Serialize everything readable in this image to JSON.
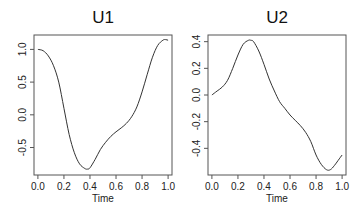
{
  "chart_data": [
    {
      "type": "line",
      "title": "U1",
      "xlabel": "Time",
      "ylabel": "",
      "xlim": [
        -0.03,
        1.03
      ],
      "ylim": [
        -0.92,
        1.22
      ],
      "xticks": [
        0.0,
        0.2,
        0.4,
        0.6,
        0.8,
        1.0
      ],
      "xtick_labels": [
        "0.0",
        "0.2",
        "0.4",
        "0.6",
        "0.8",
        "1.0"
      ],
      "yticks": [
        -0.5,
        0.0,
        0.5,
        1.0
      ],
      "ytick_labels": [
        "-0.5",
        "0.0",
        "0.5",
        "1.0"
      ],
      "grid": false,
      "series": [
        {
          "name": "U1",
          "x": [
            0.0,
            0.04,
            0.08,
            0.12,
            0.16,
            0.2,
            0.24,
            0.28,
            0.32,
            0.36,
            0.38,
            0.4,
            0.44,
            0.48,
            0.52,
            0.56,
            0.6,
            0.64,
            0.68,
            0.72,
            0.76,
            0.8,
            0.84,
            0.88,
            0.92,
            0.96,
            0.98,
            1.0
          ],
          "y": [
            1.0,
            0.98,
            0.9,
            0.75,
            0.5,
            0.1,
            -0.3,
            -0.58,
            -0.75,
            -0.82,
            -0.83,
            -0.81,
            -0.68,
            -0.53,
            -0.42,
            -0.33,
            -0.26,
            -0.2,
            -0.13,
            -0.03,
            0.12,
            0.35,
            0.62,
            0.88,
            1.06,
            1.14,
            1.15,
            1.14
          ]
        }
      ]
    },
    {
      "type": "line",
      "title": "U2",
      "xlabel": "Time",
      "ylabel": "",
      "xlim": [
        -0.03,
        1.03
      ],
      "ylim": [
        -0.6,
        0.45
      ],
      "xticks": [
        0.0,
        0.2,
        0.4,
        0.6,
        0.8,
        1.0
      ],
      "xtick_labels": [
        "0.0",
        "0.2",
        "0.4",
        "0.6",
        "0.8",
        "1.0"
      ],
      "yticks": [
        -0.4,
        -0.2,
        0.0,
        0.2,
        0.4
      ],
      "ytick_labels": [
        "-0.4",
        "-0.2",
        "0.0",
        "0.2",
        "0.4"
      ],
      "grid": false,
      "series": [
        {
          "name": "U2",
          "x": [
            0.0,
            0.04,
            0.08,
            0.12,
            0.16,
            0.2,
            0.24,
            0.28,
            0.3,
            0.32,
            0.36,
            0.4,
            0.44,
            0.48,
            0.52,
            0.56,
            0.6,
            0.64,
            0.68,
            0.72,
            0.76,
            0.8,
            0.84,
            0.88,
            0.91,
            0.94,
            0.97,
            1.0
          ],
          "y": [
            0.0,
            0.03,
            0.06,
            0.11,
            0.2,
            0.3,
            0.38,
            0.41,
            0.41,
            0.4,
            0.33,
            0.23,
            0.12,
            0.03,
            -0.05,
            -0.1,
            -0.15,
            -0.19,
            -0.23,
            -0.28,
            -0.35,
            -0.45,
            -0.52,
            -0.56,
            -0.56,
            -0.53,
            -0.49,
            -0.45
          ]
        }
      ]
    }
  ]
}
